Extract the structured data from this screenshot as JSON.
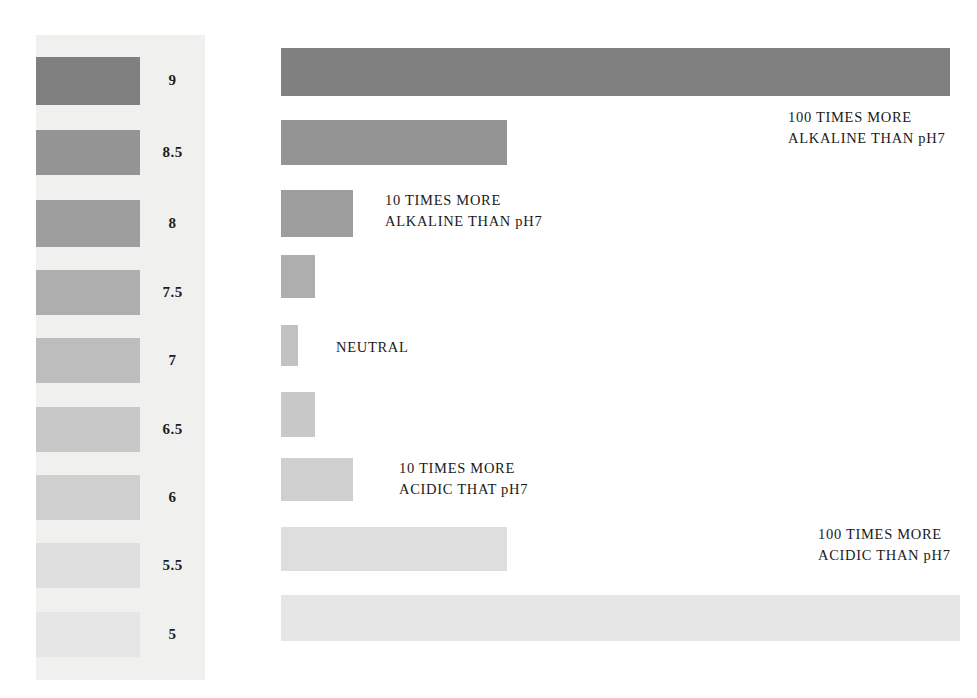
{
  "chart_data": {
    "type": "bar",
    "orientation": "horizontal",
    "title": "",
    "xlabel": "",
    "ylabel": "pH",
    "categories": [
      "9",
      "8.5",
      "8",
      "7.5",
      "7",
      "6.5",
      "6",
      "5.5",
      "5"
    ],
    "values": [
      669,
      226,
      72,
      34,
      17,
      34,
      72,
      226,
      679
    ],
    "value_unit": "relative bar length (px)",
    "grid": false,
    "legend_position": "left",
    "bars": [
      {
        "ph": "9",
        "length": 669,
        "color": "#808080",
        "top": 48,
        "height": 48
      },
      {
        "ph": "8.5",
        "length": 226,
        "color": "#949494",
        "top": 120,
        "height": 45
      },
      {
        "ph": "8",
        "length": 72,
        "color": "#9e9e9e",
        "top": 190,
        "height": 47
      },
      {
        "ph": "7.5",
        "length": 34,
        "color": "#aeaeae",
        "top": 255,
        "height": 43
      },
      {
        "ph": "7",
        "length": 17,
        "color": "#c2c2c2",
        "top": 325,
        "height": 41
      },
      {
        "ph": "6.5",
        "length": 34,
        "color": "#c8c8c8",
        "top": 392,
        "height": 45
      },
      {
        "ph": "6",
        "length": 72,
        "color": "#cfcfcf",
        "top": 458,
        "height": 43
      },
      {
        "ph": "5.5",
        "length": 226,
        "color": "#dedede",
        "top": 527,
        "height": 44
      },
      {
        "ph": "5",
        "length": 679,
        "color": "#e6e6e6",
        "top": 595,
        "height": 46
      }
    ],
    "legend": {
      "background": "#f0f0ef",
      "items": [
        {
          "label": "9",
          "color": "#808080",
          "top": 22,
          "height": 48
        },
        {
          "label": "8.5",
          "color": "#949494",
          "top": 95,
          "height": 45
        },
        {
          "label": "8",
          "color": "#9e9e9e",
          "top": 165,
          "height": 47
        },
        {
          "label": "7.5",
          "color": "#aeaeae",
          "top": 235,
          "height": 45
        },
        {
          "label": "7",
          "color": "#bdbdbd",
          "top": 303,
          "height": 45
        },
        {
          "label": "6.5",
          "color": "#c8c8c8",
          "top": 372,
          "height": 45
        },
        {
          "label": "6",
          "color": "#cfcfcf",
          "top": 440,
          "height": 45
        },
        {
          "label": "5.5",
          "color": "#dedede",
          "top": 508,
          "height": 45
        },
        {
          "label": "5",
          "color": "#e6e6e6",
          "top": 577,
          "height": 45
        }
      ]
    },
    "annotations": [
      {
        "id": "alkaline-100",
        "line1": "100 TIMES MORE",
        "line2": "ALKALINE THAN pH7",
        "left": 788,
        "top": 107,
        "relates_to_ph": "9"
      },
      {
        "id": "alkaline-10",
        "line1": "10 TIMES MORE",
        "line2": "ALKALINE THAN pH7",
        "left": 385,
        "top": 190,
        "relates_to_ph": "8"
      },
      {
        "id": "neutral",
        "line1": "NEUTRAL",
        "line2": "",
        "left": 336,
        "top": 337,
        "relates_to_ph": "7"
      },
      {
        "id": "acidic-10",
        "line1": "10 TIMES MORE",
        "line2": "ACIDIC THAT pH7",
        "left": 399,
        "top": 458,
        "relates_to_ph": "6"
      },
      {
        "id": "acidic-100",
        "line1": "100 TIMES MORE",
        "line2": "ACIDIC THAN pH7",
        "left": 818,
        "top": 524,
        "relates_to_ph": "5"
      }
    ]
  }
}
